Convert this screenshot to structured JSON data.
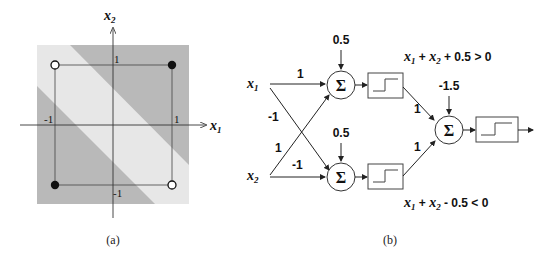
{
  "figure_a": {
    "caption": "(a)",
    "axis_x_label": "x",
    "axis_x_sub": "1",
    "axis_y_label": "x",
    "axis_y_sub": "2",
    "tick_x_neg": "-1",
    "tick_x_pos": "1",
    "tick_y_pos": "1",
    "tick_y_neg": "-1",
    "colors": {
      "dark_region": "#b8b8b8",
      "light_band": "#e6e6e6"
    },
    "points": [
      {
        "x": -1,
        "y": 1,
        "class": "open"
      },
      {
        "x": 1,
        "y": 1,
        "class": "filled"
      },
      {
        "x": -1,
        "y": -1,
        "class": "filled"
      },
      {
        "x": 1,
        "y": -1,
        "class": "open"
      }
    ]
  },
  "figure_b": {
    "caption": "(b)",
    "input1_label": "x",
    "input1_sub": "1",
    "input2_label": "x",
    "input2_sub": "2",
    "sum_symbol": "Σ",
    "bias_top": "0.5",
    "bias_bottom": "0.5",
    "bias_output": "-1.5",
    "w_x1_top": "1",
    "w_x1_bottom": "-1",
    "w_x2_top": "1",
    "w_x2_bottom": "-1",
    "w_top_out": "1",
    "w_bottom_out": "1",
    "eq_top": {
      "a": "x",
      "a_sub": "1",
      "plus1": " + ",
      "b": "x",
      "b_sub": "2",
      "rest": " + 0.5 > 0"
    },
    "eq_bottom": {
      "a": "x",
      "a_sub": "1",
      "plus1": " + ",
      "b": "x",
      "b_sub": "2",
      "rest": " - 0.5 < 0"
    }
  }
}
